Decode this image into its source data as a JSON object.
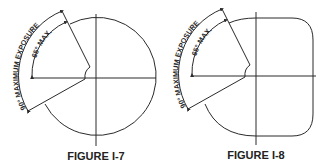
{
  "figures": [
    {
      "id": "I-7",
      "caption": "FIGURE I-7",
      "shape": "circle",
      "outer_label": "90° MAXIMUM EXPOSURE",
      "inner_label": "65° MAX."
    },
    {
      "id": "I-8",
      "caption": "FIGURE I-8",
      "shape": "rounded-square",
      "outer_label": "90° MAXIMUM EXPOSURE",
      "inner_label": "65° MAX."
    }
  ],
  "colors": {
    "line": "#2a2a2a",
    "background": "#ffffff"
  }
}
